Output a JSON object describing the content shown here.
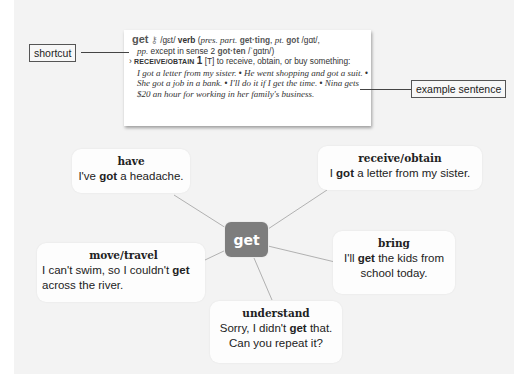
{
  "entry": {
    "headword": "get",
    "key_icon": "key-icon",
    "pron": "/gɛt/",
    "pos": "verb",
    "forms_open": "(",
    "pres_part_label": "pres. part.",
    "pres_part": "get·ting",
    "pt_label": "pt.",
    "pt": "got",
    "pt_pron": "/gɑt/,",
    "pp_label": "pp.",
    "pp_text": "except in sense 2",
    "pp_form": "got·ten",
    "pp_pron": "/ˈgɑtn/)",
    "shortcut_arrow": "›",
    "shortcut": "RECEIVE/OBTAIN",
    "sense_num": "1",
    "grammar": "[T]",
    "definition": "to receive, obtain, or buy something:",
    "examples": [
      "I got a letter from my sister.",
      "He went shopping and got a suit.",
      "She got a job in a bank.",
      "I'll do it if I get the time.",
      "Nina gets $20 an hour for working in her family's business."
    ],
    "bullet": "•"
  },
  "labels": {
    "shortcut": "shortcut",
    "example_sentence": "example sentence"
  },
  "mindmap": {
    "center": "get",
    "nodes": [
      {
        "title": "have",
        "pre": "I've ",
        "bold": "got",
        "post": " a headache."
      },
      {
        "title": "receive/obtain",
        "pre": "I ",
        "bold": "got",
        "post": " a letter from my sister."
      },
      {
        "title": "move/travel",
        "pre": "I can't swim, so I couldn't ",
        "bold": "get",
        "post": " across the river."
      },
      {
        "title": "bring",
        "pre": "I'll ",
        "bold": "get",
        "post": " the kids from school today."
      },
      {
        "title": "understand",
        "pre": "Sorry, I didn't ",
        "bold": "get",
        "post": " that. Can you repeat it?"
      }
    ]
  },
  "colors": {
    "panel": "#f3f3f3",
    "center_node": "#7d7d7d",
    "bubble": "#fdfdfd",
    "line": "#999999"
  }
}
